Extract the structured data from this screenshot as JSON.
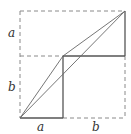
{
  "diagram": {
    "labels": {
      "left_top": "a",
      "left_bottom": "b",
      "bottom_left": "a",
      "bottom_right": "b"
    },
    "colors": {
      "solid": "#555555",
      "dashed": "#8a8a8a",
      "text": "#333333"
    }
  }
}
